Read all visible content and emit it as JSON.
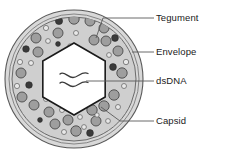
{
  "figure": {
    "type": "diagram",
    "labels": [
      {
        "id": "tegument",
        "text": "Tegument"
      },
      {
        "id": "envelope",
        "text": "Envelope"
      },
      {
        "id": "dsdna",
        "text": "dsDNA"
      },
      {
        "id": "capsid",
        "text": "Capsid"
      }
    ]
  },
  "colors": {
    "background": "#ffffff",
    "envelope_fill": "#d8d8d8",
    "envelope_outline": "#5a5a5a",
    "tegument_fill": "#cfcfcf",
    "capsid_fill": "#ffffff",
    "capsid_outline": "#1a1a1a",
    "particle_gray": "#9e9e9e",
    "particle_dark": "#3a3a3a",
    "particle_light": "#e8e8e8",
    "dna_stroke": "#3a3a3a",
    "leader_line": "#5a5a5a",
    "label_text": "#1a1a1a"
  },
  "geometry": {
    "center_x": 74,
    "center_y": 79,
    "envelope_outer_r": 69,
    "envelope_mid_r": 65,
    "envelope_inner_r": 62,
    "capsid_radius": 36
  },
  "particles": [
    {
      "cx": 74,
      "cy": 19,
      "r": 5.2,
      "kind": "gray"
    },
    {
      "cx": 59,
      "cy": 21,
      "r": 3.6,
      "kind": "dark"
    },
    {
      "cx": 90,
      "cy": 21,
      "r": 5.0,
      "kind": "gray"
    },
    {
      "cx": 46,
      "cy": 28,
      "r": 2.6,
      "kind": "light"
    },
    {
      "cx": 104,
      "cy": 28,
      "r": 5.0,
      "kind": "gray"
    },
    {
      "cx": 36,
      "cy": 38,
      "r": 5.0,
      "kind": "gray"
    },
    {
      "cx": 58,
      "cy": 33,
      "r": 5.0,
      "kind": "gray"
    },
    {
      "cx": 76,
      "cy": 33,
      "r": 2.5,
      "kind": "light"
    },
    {
      "cx": 115,
      "cy": 38,
      "r": 3.4,
      "kind": "dark"
    },
    {
      "cx": 48,
      "cy": 41,
      "r": 2.4,
      "kind": "light"
    },
    {
      "cx": 94,
      "cy": 40,
      "r": 5.0,
      "kind": "gray"
    },
    {
      "cx": 106,
      "cy": 41,
      "r": 5.0,
      "kind": "gray"
    },
    {
      "cx": 26,
      "cy": 49,
      "r": 3.3,
      "kind": "dark"
    },
    {
      "cx": 38,
      "cy": 52,
      "r": 5.0,
      "kind": "gray"
    },
    {
      "cx": 58,
      "cy": 44,
      "r": 2.4,
      "kind": "dark"
    },
    {
      "cx": 118,
      "cy": 51,
      "r": 5.0,
      "kind": "gray"
    },
    {
      "cx": 20,
      "cy": 62,
      "r": 2.6,
      "kind": "light"
    },
    {
      "cx": 31,
      "cy": 63,
      "r": 2.5,
      "kind": "light"
    },
    {
      "cx": 109,
      "cy": 55,
      "r": 2.4,
      "kind": "light"
    },
    {
      "cx": 126,
      "cy": 62,
      "r": 2.7,
      "kind": "light"
    },
    {
      "cx": 21,
      "cy": 73,
      "r": 5.0,
      "kind": "gray"
    },
    {
      "cx": 113,
      "cy": 67,
      "r": 3.4,
      "kind": "dark"
    },
    {
      "cx": 122,
      "cy": 73,
      "r": 5.2,
      "kind": "gray"
    },
    {
      "cx": 17,
      "cy": 86,
      "r": 2.6,
      "kind": "light"
    },
    {
      "cx": 29,
      "cy": 85,
      "r": 3.3,
      "kind": "dark"
    },
    {
      "cx": 124,
      "cy": 86,
      "r": 2.5,
      "kind": "light"
    },
    {
      "cx": 22,
      "cy": 97,
      "r": 5.0,
      "kind": "gray"
    },
    {
      "cx": 114,
      "cy": 95,
      "r": 5.2,
      "kind": "gray"
    },
    {
      "cx": 34,
      "cy": 105,
      "r": 5.0,
      "kind": "gray"
    },
    {
      "cx": 46,
      "cy": 99,
      "r": 2.5,
      "kind": "light"
    },
    {
      "cx": 104,
      "cy": 106,
      "r": 5.2,
      "kind": "gray"
    },
    {
      "cx": 118,
      "cy": 107,
      "r": 2.5,
      "kind": "light"
    },
    {
      "cx": 49,
      "cy": 112,
      "r": 5.0,
      "kind": "gray"
    },
    {
      "cx": 62,
      "cy": 110,
      "r": 2.5,
      "kind": "light"
    },
    {
      "cx": 92,
      "cy": 110,
      "r": 5.2,
      "kind": "gray"
    },
    {
      "cx": 40,
      "cy": 120,
      "r": 2.4,
      "kind": "dark"
    },
    {
      "cx": 68,
      "cy": 120,
      "r": 5.0,
      "kind": "gray"
    },
    {
      "cx": 80,
      "cy": 117,
      "r": 2.4,
      "kind": "light"
    },
    {
      "cx": 96,
      "cy": 121,
      "r": 5.0,
      "kind": "gray"
    },
    {
      "cx": 55,
      "cy": 124,
      "r": 5.0,
      "kind": "gray"
    },
    {
      "cx": 84,
      "cy": 127,
      "r": 2.4,
      "kind": "light"
    },
    {
      "cx": 108,
      "cy": 121,
      "r": 2.4,
      "kind": "light"
    },
    {
      "cx": 64,
      "cy": 132,
      "r": 2.5,
      "kind": "light"
    },
    {
      "cx": 76,
      "cy": 131,
      "r": 5.2,
      "kind": "gray"
    },
    {
      "cx": 90,
      "cy": 133,
      "r": 3.4,
      "kind": "dark"
    },
    {
      "cx": 48,
      "cy": 90,
      "r": 2.4,
      "kind": "light"
    },
    {
      "cx": 103,
      "cy": 86,
      "r": 2.4,
      "kind": "light"
    },
    {
      "cx": 70,
      "cy": 46,
      "r": 2.2,
      "kind": "light"
    },
    {
      "cx": 97,
      "cy": 115,
      "r": 2.2,
      "kind": "light"
    }
  ]
}
